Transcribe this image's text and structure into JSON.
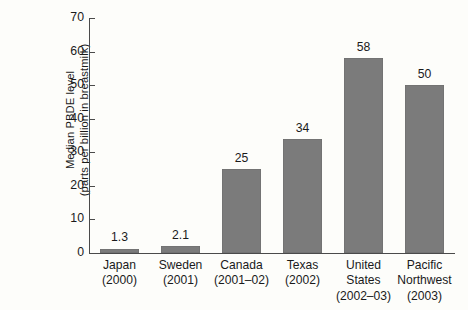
{
  "chart_data": {
    "type": "bar",
    "title": "",
    "xlabel": "",
    "ylabel": "Median PBDE level\n(parts per billion in breastmilk)",
    "ylabel_lines": [
      "Median PBDE level",
      "(parts per billion in breastmilk)"
    ],
    "ylim": [
      0,
      70
    ],
    "yticks": [
      0,
      10,
      20,
      30,
      40,
      50,
      60,
      70
    ],
    "ytick_labels": [
      "0",
      "10",
      "20",
      "30",
      "40",
      "50",
      "60",
      "70"
    ],
    "grid": false,
    "legend": "none",
    "categories": [
      "Japan (2000)",
      "Sweden (2001)",
      "Canada (2001–02)",
      "Texas (2002)",
      "United States (2002–03)",
      "Pacific Northwest (2003)"
    ],
    "category_lines": [
      [
        "Japan",
        "(2000)"
      ],
      [
        "Sweden",
        "(2001)"
      ],
      [
        "Canada",
        "(2001–02)"
      ],
      [
        "Texas",
        "(2002)"
      ],
      [
        "United",
        "States",
        "(2002–03)"
      ],
      [
        "Pacific",
        "Northwest",
        "(2003)"
      ]
    ],
    "values": [
      1.3,
      2.1,
      25,
      34,
      58,
      50
    ],
    "value_labels": [
      "1.3",
      "2.1",
      "25",
      "34",
      "58",
      "50"
    ],
    "bar_color": "#7b7b7b",
    "axis_color": "#4a4a4a",
    "background_color": "#fdfdfa"
  }
}
